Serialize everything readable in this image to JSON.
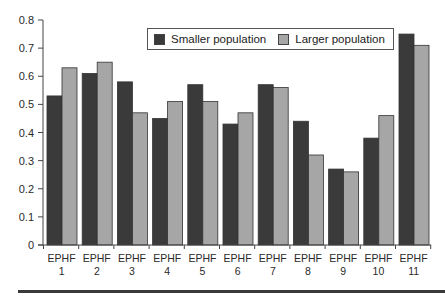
{
  "chart_data": {
    "type": "bar",
    "title": "",
    "xlabel": "",
    "ylabel": "",
    "ylim": [
      0,
      0.8
    ],
    "yticks": [
      "0",
      "0.1",
      "0.2",
      "0.3",
      "0.4",
      "0.5",
      "0.6",
      "0.7",
      "0.8"
    ],
    "grid": false,
    "legend_position": "top-center (inside plot)",
    "categories": [
      "EPHF 1",
      "EPHF 2",
      "EPHF 3",
      "EPHF 4",
      "EPHF 5",
      "EPHF 6",
      "EPHF 7",
      "EPHF 8",
      "EPHF 9",
      "EPHF 10",
      "EPHF 11"
    ],
    "category_lines": [
      [
        "EPHF",
        "1"
      ],
      [
        "EPHF",
        "2"
      ],
      [
        "EPHF",
        "3"
      ],
      [
        "EPHF",
        "4"
      ],
      [
        "EPHF",
        "5"
      ],
      [
        "EPHF",
        "6"
      ],
      [
        "EPHF",
        "7"
      ],
      [
        "EPHF",
        "8"
      ],
      [
        "EPHF",
        "9"
      ],
      [
        "EPHF",
        "10"
      ],
      [
        "EPHF",
        "11"
      ]
    ],
    "series": [
      {
        "name": "Smaller population",
        "color": "#3a3a3a",
        "values": [
          0.53,
          0.61,
          0.58,
          0.45,
          0.57,
          0.43,
          0.57,
          0.44,
          0.27,
          0.38,
          0.75
        ]
      },
      {
        "name": "Larger population",
        "color": "#a6a6a6",
        "values": [
          0.63,
          0.65,
          0.47,
          0.51,
          0.51,
          0.47,
          0.56,
          0.32,
          0.26,
          0.46,
          0.71
        ]
      }
    ]
  },
  "legend": {
    "items": [
      {
        "label": "Smaller population",
        "color": "#3a3a3a"
      },
      {
        "label": "Larger population",
        "color": "#a6a6a6"
      }
    ]
  }
}
